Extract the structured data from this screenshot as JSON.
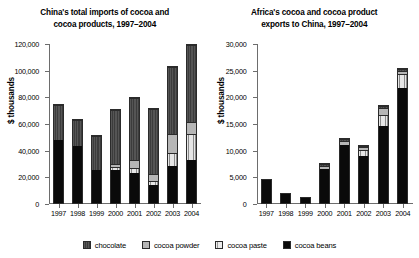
{
  "legend": {
    "items": [
      {
        "key": "chocolate",
        "label": "chocolate"
      },
      {
        "key": "powder",
        "label": "cocoa powder"
      },
      {
        "key": "paste",
        "label": "cocoa paste"
      },
      {
        "key": "beans",
        "label": "cocoa beans"
      }
    ]
  },
  "chart_data": [
    {
      "type": "bar",
      "stacked": true,
      "title_line1": "China's total imports of cocoa and",
      "title_line2": "cocoa products, 1997–2004",
      "title": "China's total imports of cocoa and cocoa products, 1997–2004",
      "xlabel": "",
      "ylabel": "$ thousands",
      "ylim": [
        0,
        120000
      ],
      "ytick_values": [
        0,
        20000,
        40000,
        60000,
        80000,
        100000,
        120000
      ],
      "ytick_labels": [
        "0",
        "20,000",
        "40,000",
        "60,000",
        "80,000",
        "100,000",
        "120,000"
      ],
      "grid": false,
      "legend_position": "bottom",
      "categories": [
        "1997",
        "1998",
        "1999",
        "2000",
        "2001",
        "2002",
        "2003",
        "2004"
      ],
      "series": [
        {
          "name": "cocoa beans",
          "key": "beans",
          "values": [
            48500,
            44000,
            25500,
            26000,
            23500,
            14500,
            29000,
            33000
          ]
        },
        {
          "name": "cocoa paste",
          "key": "paste",
          "values": [
            0,
            0,
            0,
            2000,
            3500,
            2000,
            9500,
            19500
          ]
        },
        {
          "name": "cocoa powder",
          "key": "powder",
          "values": [
            0,
            0,
            0,
            1000,
            5500,
            5000,
            13500,
            8500
          ]
        },
        {
          "name": "chocolate",
          "key": "chocolate",
          "values": [
            26500,
            19500,
            26500,
            42000,
            48000,
            50500,
            51500,
            59000
          ]
        }
      ],
      "totals": [
        75000,
        63500,
        52000,
        71000,
        80500,
        72000,
        103500,
        120000
      ]
    },
    {
      "type": "bar",
      "stacked": true,
      "title_line1": "Africa's cocoa and cocoa product",
      "title_line2": "exports to China, 1997–2004",
      "title": "Africa's cocoa and cocoa product exports to China, 1997–2004",
      "xlabel": "",
      "ylabel": "$ thousands",
      "ylim": [
        0,
        30000
      ],
      "ytick_values": [
        0,
        5000,
        10000,
        15000,
        20000,
        25000,
        30000
      ],
      "ytick_labels": [
        "0",
        "5,000",
        "10,000",
        "15,000",
        "20,000",
        "25,000",
        "30,000"
      ],
      "grid": false,
      "legend_position": "bottom",
      "categories": [
        "1997",
        "1998",
        "1999",
        "2000",
        "2001",
        "2002",
        "2003",
        "2004"
      ],
      "series": [
        {
          "name": "cocoa beans",
          "key": "beans",
          "values": [
            4600,
            2000,
            1400,
            7100,
            11600,
            9600,
            15300,
            22300
          ]
        },
        {
          "name": "cocoa paste",
          "key": "paste",
          "values": [
            0,
            0,
            0,
            0,
            0,
            1100,
            1900,
            2600
          ]
        },
        {
          "name": "cocoa powder",
          "key": "powder",
          "values": [
            0,
            0,
            0,
            400,
            500,
            300,
            1100,
            400
          ]
        },
        {
          "name": "chocolate",
          "key": "chocolate",
          "values": [
            0,
            0,
            0,
            100,
            250,
            100,
            200,
            200
          ]
        }
      ],
      "totals": [
        4600,
        2000,
        1400,
        7600,
        12350,
        11100,
        18500,
        25500
      ]
    }
  ]
}
